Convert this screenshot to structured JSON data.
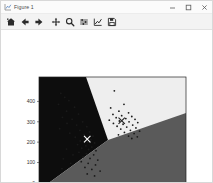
{
  "window": {
    "title": "Figure 1",
    "app_icon": "chart-icon",
    "controls": [
      {
        "name": "minimize-button",
        "glyph": "minimize-icon"
      },
      {
        "name": "maximize-button",
        "glyph": "maximize-icon"
      },
      {
        "name": "close-button",
        "glyph": "close-icon"
      }
    ]
  },
  "toolbar": {
    "items": [
      {
        "name": "home-button",
        "icon": "home-icon",
        "tooltip": "Reset original view"
      },
      {
        "name": "back-button",
        "icon": "arrow-left-icon",
        "tooltip": "Back to previous view"
      },
      {
        "name": "forward-button",
        "icon": "arrow-right-icon",
        "tooltip": "Forward to next view"
      },
      {
        "name": "pan-button",
        "icon": "move-icon",
        "tooltip": "Pan axes with left mouse, zoom with right"
      },
      {
        "name": "zoom-button",
        "icon": "magnifier-icon",
        "tooltip": "Zoom to rectangle"
      },
      {
        "name": "subplots-button",
        "icon": "sliders-icon",
        "tooltip": "Configure subplots"
      },
      {
        "name": "customize-button",
        "icon": "axes-edit-icon",
        "tooltip": "Edit axis, curve and image parameters"
      },
      {
        "name": "save-button",
        "icon": "floppy-icon",
        "tooltip": "Save the figure"
      }
    ]
  },
  "chart_data": {
    "type": "scatter",
    "title": "",
    "xlabel": "",
    "ylabel": "",
    "xlim": [
      -60,
      580
    ],
    "ylim": [
      -35,
      520
    ],
    "xticks": [
      0,
      100,
      200,
      300,
      400,
      500
    ],
    "yticks": [
      0,
      100,
      200,
      300,
      400
    ],
    "xticklabels": [
      "0",
      "100",
      "200",
      "300",
      "400",
      "500"
    ],
    "yticklabels": [
      "0",
      "100",
      "200",
      "300",
      "400"
    ],
    "grid": false,
    "legend": null,
    "background": "#ffffff",
    "regions": [
      {
        "name": "cluster-region-0",
        "color": "#0d0d0d",
        "label": "left region"
      },
      {
        "name": "cluster-region-1",
        "color": "#eeeeee",
        "label": "upper region"
      },
      {
        "name": "cluster-region-2",
        "color": "#5a5a5a",
        "label": "lower-right region"
      }
    ],
    "centroids": [
      {
        "x": 150,
        "y": 215,
        "marker": "x",
        "color": "#ffffff"
      },
      {
        "x": 300,
        "y": 305,
        "marker": "x",
        "color": "#222222"
      }
    ],
    "points": [
      {
        "x": 35,
        "y": 440
      },
      {
        "x": 52,
        "y": 420
      },
      {
        "x": 70,
        "y": 404
      },
      {
        "x": 25,
        "y": 386
      },
      {
        "x": 95,
        "y": 372
      },
      {
        "x": 60,
        "y": 352
      },
      {
        "x": 112,
        "y": 338
      },
      {
        "x": 42,
        "y": 322
      },
      {
        "x": 84,
        "y": 312
      },
      {
        "x": 130,
        "y": 300
      },
      {
        "x": 62,
        "y": 292
      },
      {
        "x": 104,
        "y": 284
      },
      {
        "x": 148,
        "y": 276
      },
      {
        "x": 30,
        "y": 266
      },
      {
        "x": 118,
        "y": 258
      },
      {
        "x": 160,
        "y": 250
      },
      {
        "x": 74,
        "y": 244
      },
      {
        "x": 136,
        "y": 236
      },
      {
        "x": 175,
        "y": 230
      },
      {
        "x": 98,
        "y": 224
      },
      {
        "x": 142,
        "y": 218
      },
      {
        "x": 166,
        "y": 212
      },
      {
        "x": 120,
        "y": 206
      },
      {
        "x": 152,
        "y": 200
      },
      {
        "x": 182,
        "y": 196
      },
      {
        "x": 108,
        "y": 188
      },
      {
        "x": 144,
        "y": 182
      },
      {
        "x": 170,
        "y": 176
      },
      {
        "x": 126,
        "y": 170
      },
      {
        "x": 156,
        "y": 164
      },
      {
        "x": 188,
        "y": 158
      },
      {
        "x": 114,
        "y": 150
      },
      {
        "x": 146,
        "y": 144
      },
      {
        "x": 178,
        "y": 138
      },
      {
        "x": 132,
        "y": 128
      },
      {
        "x": 162,
        "y": 120
      },
      {
        "x": 196,
        "y": 112
      },
      {
        "x": 124,
        "y": 104
      },
      {
        "x": 154,
        "y": 96
      },
      {
        "x": 186,
        "y": 88
      },
      {
        "x": 140,
        "y": 76
      },
      {
        "x": 170,
        "y": 66
      },
      {
        "x": 206,
        "y": 58
      },
      {
        "x": 150,
        "y": 44
      },
      {
        "x": 182,
        "y": 34
      },
      {
        "x": 60,
        "y": 166
      },
      {
        "x": 88,
        "y": 138
      },
      {
        "x": 46,
        "y": 118
      },
      {
        "x": 78,
        "y": 96
      },
      {
        "x": 40,
        "y": 70
      },
      {
        "x": 268,
        "y": 452
      },
      {
        "x": 310,
        "y": 386
      },
      {
        "x": 252,
        "y": 368
      },
      {
        "x": 288,
        "y": 352
      },
      {
        "x": 330,
        "y": 344
      },
      {
        "x": 262,
        "y": 336
      },
      {
        "x": 300,
        "y": 330
      },
      {
        "x": 344,
        "y": 326
      },
      {
        "x": 276,
        "y": 320
      },
      {
        "x": 318,
        "y": 316
      },
      {
        "x": 358,
        "y": 312
      },
      {
        "x": 246,
        "y": 308
      },
      {
        "x": 290,
        "y": 304
      },
      {
        "x": 332,
        "y": 300
      },
      {
        "x": 370,
        "y": 296
      },
      {
        "x": 264,
        "y": 292
      },
      {
        "x": 306,
        "y": 288
      },
      {
        "x": 348,
        "y": 284
      },
      {
        "x": 280,
        "y": 278
      },
      {
        "x": 322,
        "y": 274
      },
      {
        "x": 362,
        "y": 270
      },
      {
        "x": 296,
        "y": 264
      },
      {
        "x": 338,
        "y": 258
      },
      {
        "x": 378,
        "y": 254
      },
      {
        "x": 312,
        "y": 248
      },
      {
        "x": 354,
        "y": 242
      },
      {
        "x": 286,
        "y": 236
      },
      {
        "x": 330,
        "y": 230
      },
      {
        "x": 368,
        "y": 226
      },
      {
        "x": 344,
        "y": 218
      }
    ]
  }
}
